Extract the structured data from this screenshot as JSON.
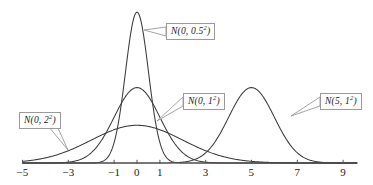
{
  "figure": {
    "title": "",
    "background_color": "#ffffff",
    "curve_color": "#3a3a3a",
    "axis_color": "#555555",
    "label_border_color": "#9a9a9a",
    "label_text_color": "#1a1a1a"
  },
  "axis": {
    "label": "",
    "min": -5,
    "max": 9.6,
    "tick_values": [
      -5,
      -3,
      -1,
      0,
      1,
      3,
      5,
      7,
      9
    ],
    "tick_labels": [
      "−5",
      "−3",
      "−1",
      "0",
      "1",
      "3",
      "5",
      "7",
      "9"
    ]
  },
  "callouts": [
    {
      "name": "normal-0-0.5",
      "base": "N(0, 0.5",
      "exp": "2",
      "tail": ")"
    },
    {
      "name": "normal-0-1",
      "base": "N(0, 1",
      "exp": "2",
      "tail": ")"
    },
    {
      "name": "normal-5-1",
      "base": "N(5, 1",
      "exp": "2",
      "tail": ")"
    },
    {
      "name": "normal-0-2",
      "base": "N(0, 2",
      "exp": "2",
      "tail": ")"
    }
  ],
  "chart_data": {
    "type": "line",
    "title": "",
    "xlabel": "",
    "ylabel": "",
    "xlim": [
      -5,
      9.6
    ],
    "ylim": [
      0,
      0.82
    ],
    "grid": false,
    "legend": "callout labels attached to curves",
    "xticks": [
      -5,
      -3,
      -1,
      0,
      1,
      3,
      5,
      7,
      9
    ],
    "series": [
      {
        "name": "N(0, 0.5²)",
        "label": "N(0, 0.5²)",
        "distribution": "normal",
        "mean": 0,
        "sigma": 0.5,
        "peak_density": 0.7979,
        "peak_x": 0
      },
      {
        "name": "N(0, 1²)",
        "label": "N(0, 1²)",
        "distribution": "normal",
        "mean": 0,
        "sigma": 1,
        "peak_density": 0.3989,
        "peak_x": 0
      },
      {
        "name": "N(5, 1²)",
        "label": "N(5, 1²)",
        "distribution": "normal",
        "mean": 5,
        "sigma": 1,
        "peak_density": 0.3989,
        "peak_x": 5
      },
      {
        "name": "N(0, 2²)",
        "label": "N(0, 2²)",
        "distribution": "normal",
        "mean": 0,
        "sigma": 2,
        "peak_density": 0.1995,
        "peak_x": 0
      }
    ]
  }
}
